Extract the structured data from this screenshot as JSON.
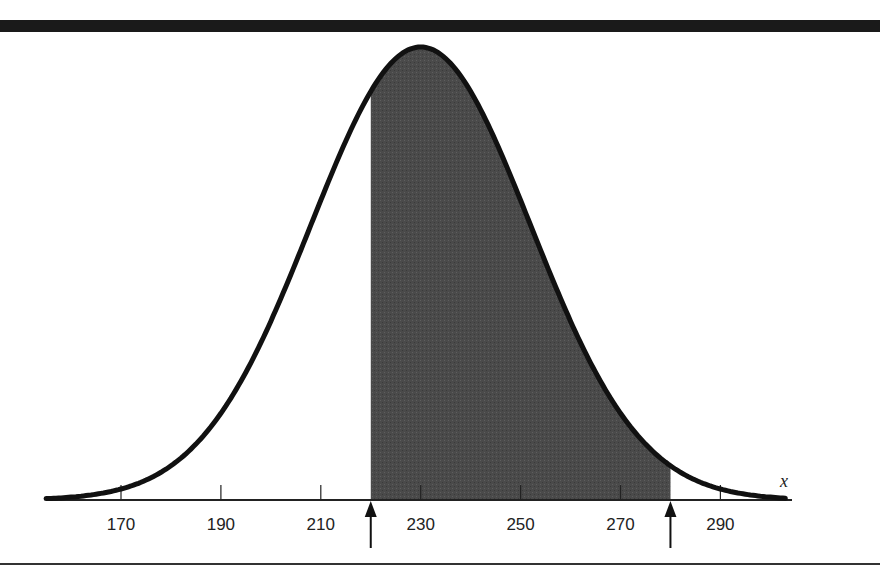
{
  "chart_data": {
    "type": "area",
    "title": "",
    "distribution": {
      "name": "normal",
      "mean": 230,
      "sd": 22
    },
    "xlabel": "x",
    "ylabel": "",
    "xlim": [
      155,
      303
    ],
    "x_ticks": [
      170,
      190,
      210,
      230,
      250,
      270,
      290
    ],
    "tick_labels": [
      "170",
      "190",
      "210",
      "230",
      "250",
      "270",
      "290"
    ],
    "shaded_region": {
      "from": 220,
      "to": 280,
      "color": "#4a4a4a"
    },
    "markers": [
      {
        "x": 220,
        "type": "arrow-up"
      },
      {
        "x": 280,
        "type": "arrow-up"
      }
    ],
    "grid": false,
    "legend": null
  },
  "axis": {
    "variable_label": "x"
  },
  "colors": {
    "curve": "#111111",
    "shade": "#4a4a4a",
    "rule": "#1a1a1a"
  }
}
